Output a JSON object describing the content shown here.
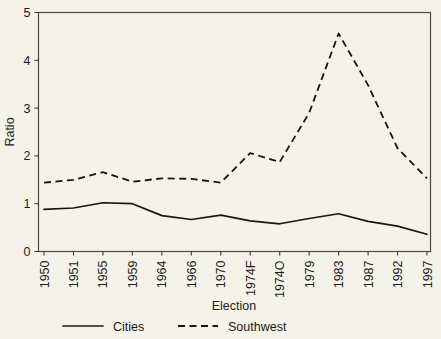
{
  "chart_data": {
    "type": "line",
    "title": "",
    "xlabel": "Election",
    "ylabel": "Ratio",
    "ylim": [
      0,
      5
    ],
    "yticks": [
      0,
      1,
      2,
      3,
      4,
      5
    ],
    "grid": false,
    "legend_position": "bottom",
    "categories": [
      "1950",
      "1951",
      "1955",
      "1959",
      "1964",
      "1966",
      "1970",
      "1974F",
      "1974O",
      "1979",
      "1983",
      "1987",
      "1992",
      "1997"
    ],
    "series": [
      {
        "name": "Cities",
        "style": "solid",
        "color": "#17170f",
        "values": [
          0.88,
          0.91,
          1.02,
          1.0,
          0.75,
          0.67,
          0.76,
          0.64,
          0.58,
          0.69,
          0.79,
          0.63,
          0.53,
          0.36
        ]
      },
      {
        "name": "Southwest",
        "style": "dashed",
        "color": "#17170f",
        "values": [
          1.44,
          1.5,
          1.66,
          1.46,
          1.53,
          1.52,
          1.44,
          2.06,
          1.87,
          2.9,
          4.56,
          3.48,
          2.16,
          1.53
        ]
      }
    ]
  },
  "axes": {
    "y_title": "Ratio",
    "x_title": "Election",
    "y_tick_labels": [
      "0",
      "1",
      "2",
      "3",
      "4",
      "5"
    ],
    "x_tick_labels": [
      "1950",
      "1951",
      "1955",
      "1959",
      "1964",
      "1966",
      "1970",
      "1974F",
      "1974O",
      "1979",
      "1983",
      "1987",
      "1992",
      "1997"
    ]
  },
  "legend": {
    "entries": [
      {
        "label": "Cities",
        "style": "solid"
      },
      {
        "label": "Southwest",
        "style": "dashed"
      }
    ]
  },
  "colors": {
    "background": "#f4f2e9",
    "plot_background": "#f4f2e9",
    "line": "#17170f",
    "axis": "#4a4a47",
    "text": "#1c1c1a"
  }
}
